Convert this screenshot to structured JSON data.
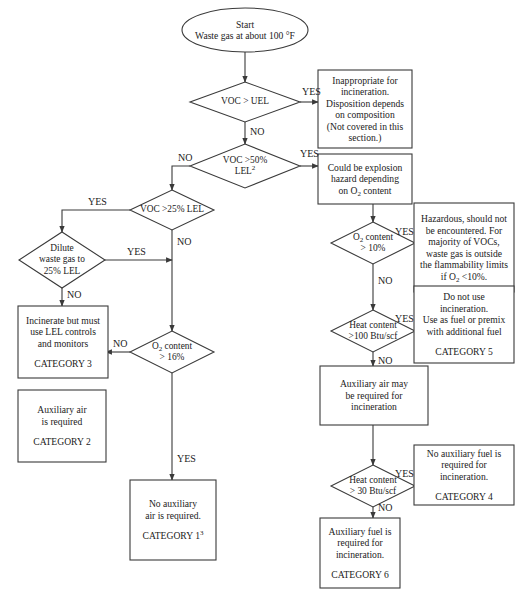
{
  "diagram": {
    "stroke_color": "#3a3a3a",
    "background": "#ffffff",
    "nodes": [
      {
        "id": "start",
        "type": "ellipse",
        "cx": 245,
        "cy": 30,
        "rx": 63,
        "ry": 22,
        "lines": [
          "Start",
          "Waste gas at about 100 °F"
        ]
      },
      {
        "id": "d_voc_uel",
        "type": "decision",
        "cx": 245,
        "cy": 102,
        "hw": 55,
        "hh": 20,
        "lines": [
          "VOC > UEL"
        ]
      },
      {
        "id": "b_inappropriate",
        "type": "box",
        "x": 318,
        "y": 70,
        "w": 94,
        "h": 78,
        "lines": [
          "Inappropriate for",
          "incineration.",
          "Disposition depends",
          "on composition",
          "(Not covered in this",
          "section.)"
        ]
      },
      {
        "id": "d_voc_50",
        "type": "decision",
        "cx": 245,
        "cy": 166,
        "hw": 55,
        "hh": 22,
        "lines": [
          "VOC >50%",
          "LEL²"
        ]
      },
      {
        "id": "b_explosion",
        "type": "box",
        "x": 318,
        "y": 154,
        "w": 94,
        "h": 50,
        "lines": [
          "Could be explosion",
          "hazard depending",
          "on O₂ content"
        ]
      },
      {
        "id": "d_voc_25",
        "type": "decision",
        "cx": 172,
        "cy": 210,
        "hw": 42,
        "hh": 20,
        "lines": [
          "VOC >25% LEL"
        ]
      },
      {
        "id": "d_dilute",
        "type": "decision",
        "cx": 62,
        "cy": 260,
        "hw": 43,
        "hh": 28,
        "lines": [
          "Dilute",
          "waste gas to",
          "25% LEL"
        ]
      },
      {
        "id": "b_cat3",
        "type": "box",
        "x": 18,
        "y": 306,
        "w": 90,
        "h": 72,
        "lines": [
          "Incinerate but must",
          "use LEL controls",
          "and monitors",
          "",
          "CATEGORY 3"
        ]
      },
      {
        "id": "d_o2_16",
        "type": "decision",
        "cx": 172,
        "cy": 352,
        "hw": 42,
        "hh": 21,
        "lines": [
          "O₂ content",
          "> 16%"
        ]
      },
      {
        "id": "b_cat2",
        "type": "box",
        "x": 18,
        "y": 390,
        "w": 88,
        "h": 72,
        "lines": [
          "Auxiliary air",
          "is required",
          "",
          "CATEGORY 2"
        ]
      },
      {
        "id": "b_cat1",
        "type": "box",
        "x": 130,
        "y": 480,
        "w": 86,
        "h": 80,
        "lines": [
          "No auxiliary",
          "air is required.",
          "",
          "CATEGORY 1³"
        ]
      },
      {
        "id": "d_o2_10",
        "type": "decision",
        "cx": 373,
        "cy": 243,
        "hw": 42,
        "hh": 21,
        "lines": [
          "O₂ content",
          "> 10%"
        ]
      },
      {
        "id": "b_hazardous",
        "type": "box",
        "x": 414,
        "y": 203,
        "w": 100,
        "h": 89,
        "lines": [
          "Hazardous, should not",
          "be encountered. For",
          "majority of VOCs,",
          "waste gas is outside",
          "the flammability limits",
          "if O₂ <10%."
        ]
      },
      {
        "id": "d_heat_100",
        "type": "decision",
        "cx": 373,
        "cy": 331,
        "hw": 42,
        "hh": 21,
        "lines": [
          "Heat content",
          ">100 Btu/scf"
        ]
      },
      {
        "id": "b_cat5",
        "type": "box",
        "x": 414,
        "y": 286,
        "w": 100,
        "h": 77,
        "lines": [
          "Do not use",
          "incineration.",
          "Use as fuel or premix",
          "with additional fuel",
          "",
          "CATEGORY 5"
        ]
      },
      {
        "id": "b_aux_air",
        "type": "box",
        "x": 320,
        "y": 366,
        "w": 108,
        "h": 59,
        "lines": [
          "Auxiliary air may",
          "be required for",
          "incineration"
        ]
      },
      {
        "id": "d_heat_30",
        "type": "decision",
        "cx": 373,
        "cy": 486,
        "hw": 42,
        "hh": 21,
        "lines": [
          "Heat content",
          "> 30 Btu/scf"
        ]
      },
      {
        "id": "b_cat4",
        "type": "box",
        "x": 414,
        "y": 445,
        "w": 100,
        "h": 60,
        "lines": [
          "No auxiliary fuel is",
          "required for",
          "incineration.",
          "",
          "CATEGORY 4"
        ]
      },
      {
        "id": "b_cat6",
        "type": "box",
        "x": 320,
        "y": 518,
        "w": 80,
        "h": 70,
        "lines": [
          "Auxiliary fuel is",
          "required for",
          "incineration.",
          "",
          "CATEGORY 6"
        ]
      }
    ],
    "edges": [
      {
        "from": "start",
        "to": "d_voc_uel",
        "points": [
          [
            245,
            52
          ],
          [
            245,
            82
          ]
        ]
      },
      {
        "from": "d_voc_uel",
        "to": "b_inappropriate",
        "points": [
          [
            300,
            102
          ],
          [
            318,
            102
          ]
        ],
        "label": "YES",
        "lx": 302,
        "ly": 86
      },
      {
        "from": "d_voc_uel",
        "to": "d_voc_50",
        "points": [
          [
            245,
            122
          ],
          [
            245,
            144
          ]
        ],
        "label": "NO",
        "lx": 250,
        "ly": 126
      },
      {
        "from": "d_voc_50",
        "to": "b_explosion",
        "points": [
          [
            300,
            166
          ],
          [
            318,
            166
          ]
        ],
        "label": "YES",
        "lx": 300,
        "ly": 148
      },
      {
        "from": "d_voc_50",
        "to": "d_voc_25",
        "points": [
          [
            190,
            166
          ],
          [
            172,
            166
          ],
          [
            172,
            190
          ]
        ],
        "label": "NO",
        "lx": 178,
        "ly": 152
      },
      {
        "from": "b_explosion",
        "to": "d_o2_10",
        "points": [
          [
            373,
            204
          ],
          [
            373,
            222
          ]
        ]
      },
      {
        "from": "d_voc_25",
        "to": "d_dilute",
        "points": [
          [
            130,
            210
          ],
          [
            62,
            210
          ],
          [
            62,
            232
          ]
        ],
        "label": "YES",
        "lx": 88,
        "ly": 196
      },
      {
        "from": "d_voc_25",
        "to": "d_o2_16",
        "points": [
          [
            172,
            230
          ],
          [
            172,
            331
          ]
        ],
        "label": "NO",
        "lx": 177,
        "ly": 236
      },
      {
        "from": "d_dilute",
        "to": "d_voc25_no_line",
        "points": [
          [
            105,
            260
          ],
          [
            172,
            260
          ]
        ],
        "label": "YES",
        "lx": 127,
        "ly": 246
      },
      {
        "from": "d_dilute",
        "to": "b_cat3",
        "points": [
          [
            62,
            288
          ],
          [
            62,
            306
          ]
        ],
        "label": "NO",
        "lx": 67,
        "ly": 289
      },
      {
        "from": "d_o2_16",
        "to": "b_cat2",
        "points": [
          [
            130,
            352
          ],
          [
            106,
            352
          ]
        ],
        "label": "NO",
        "lx": 113,
        "ly": 338
      },
      {
        "from": "d_o2_16",
        "to": "b_cat1",
        "points": [
          [
            172,
            373
          ],
          [
            172,
            480
          ]
        ],
        "label": "YES",
        "lx": 177,
        "ly": 453
      },
      {
        "from": "d_o2_10",
        "to": "b_hazardous",
        "points": [
          [
            415,
            243
          ],
          [
            414,
            243
          ]
        ],
        "label": "YES",
        "lx": 395,
        "ly": 226
      },
      {
        "from": "d_o2_10",
        "to": "d_heat_100",
        "points": [
          [
            373,
            264
          ],
          [
            373,
            310
          ]
        ],
        "label": "NO",
        "lx": 378,
        "ly": 275
      },
      {
        "from": "d_heat_100",
        "to": "b_cat5",
        "points": [
          [
            415,
            331
          ],
          [
            414,
            331
          ]
        ],
        "label": "YES",
        "lx": 395,
        "ly": 313
      },
      {
        "from": "d_heat_100",
        "to": "b_aux_air",
        "points": [
          [
            373,
            352
          ],
          [
            373,
            366
          ]
        ],
        "label": "NO",
        "lx": 378,
        "ly": 355
      },
      {
        "from": "b_aux_air",
        "to": "d_heat_30",
        "points": [
          [
            373,
            425
          ],
          [
            373,
            465
          ]
        ]
      },
      {
        "from": "d_heat_30",
        "to": "b_cat4",
        "points": [
          [
            415,
            486
          ],
          [
            414,
            486
          ]
        ],
        "label": "YES",
        "lx": 395,
        "ly": 468
      },
      {
        "from": "d_heat_30",
        "to": "b_cat6",
        "points": [
          [
            373,
            507
          ],
          [
            373,
            518
          ]
        ],
        "label": "NO",
        "lx": 378,
        "ly": 502
      }
    ]
  }
}
